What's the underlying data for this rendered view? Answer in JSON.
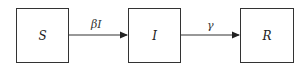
{
  "diagram": {
    "type": "compartment-flow",
    "nodes": [
      {
        "id": "S",
        "label": "S"
      },
      {
        "id": "I",
        "label": "I"
      },
      {
        "id": "R",
        "label": "R"
      }
    ],
    "edges": [
      {
        "from": "S",
        "to": "I",
        "label": "βI"
      },
      {
        "from": "I",
        "to": "R",
        "label": "γ"
      }
    ],
    "colors": {
      "stroke": "#333333",
      "background": "#ffffff"
    }
  }
}
